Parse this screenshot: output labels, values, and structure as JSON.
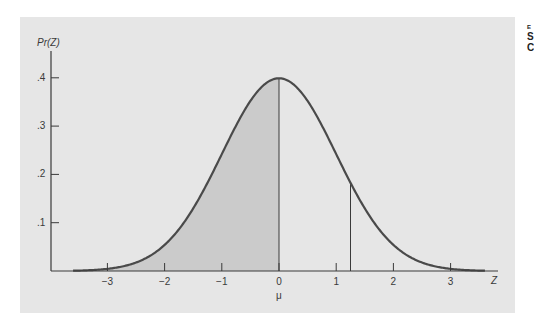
{
  "chart_data": {
    "type": "area",
    "title": "",
    "xlabel": "Z",
    "ylabel": "Pr(Z)",
    "x_ticks": [
      -3,
      -2,
      -1,
      0,
      1,
      2,
      3
    ],
    "x_tick_labels": [
      "−3",
      "−2",
      "−1",
      "0",
      "1",
      "2",
      "3"
    ],
    "x_sub_label": {
      "at": 0,
      "text": "μ"
    },
    "y_ticks": [
      0.1,
      0.2,
      0.3,
      0.4
    ],
    "y_tick_labels": [
      ".1",
      ".2",
      ".3",
      ".4"
    ],
    "xlim": [
      -3.6,
      3.6
    ],
    "ylim": [
      0,
      0.45
    ],
    "grid": false,
    "series": [
      {
        "name": "standard normal density",
        "function": "exp(-z^2/2)/sqrt(2*pi)",
        "x_range": [
          -3.6,
          3.6
        ]
      }
    ],
    "shaded_region": {
      "from": -3,
      "to": 0,
      "color": "#cbcbcb"
    },
    "vertical_lines": [
      {
        "at": -3,
        "to_curve": true
      },
      {
        "at": 0,
        "to_curve": true
      },
      {
        "at": 1.25,
        "to_curve": true
      }
    ]
  },
  "colors": {
    "panel": "#e6e6e6",
    "curve": "#4a4a4a",
    "shade": "#cbcbcb",
    "axis": "#3a3a3a"
  },
  "caption_fragment": [
    "E",
    "S",
    "C"
  ]
}
